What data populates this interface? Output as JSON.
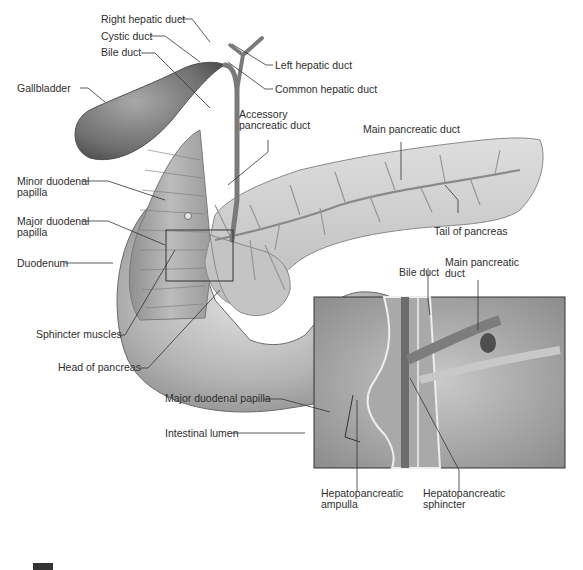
{
  "figure": {
    "labels": {
      "right_hepatic_duct": "Right hepatic duct",
      "cystic_duct": "Cystic duct",
      "bile_duct": "Bile duct",
      "left_hepatic_duct": "Left hepatic duct",
      "common_hepatic_duct": "Common hepatic duct",
      "gallbladder": "Gallbladder",
      "accessory_pancreatic_duct_1": "Accessory",
      "accessory_pancreatic_duct_2": "pancreatic duct",
      "main_pancreatic_duct": "Main pancreatic duct",
      "minor_duodenal_papilla_1": "Minor duodenal",
      "minor_duodenal_papilla_2": "papilla",
      "major_duodenal_papilla_1": "Major duodenal",
      "major_duodenal_papilla_2": "papilla",
      "tail_of_pancreas": "Tail of pancreas",
      "duodenum": "Duodenum",
      "sphincter_muscles": "Sphincter muscles",
      "head_of_pancreas": "Head of pancreas"
    },
    "inset_labels": {
      "bile_duct": "Bile duct",
      "main_pancreatic_duct_1": "Main pancreatic",
      "main_pancreatic_duct_2": "duct",
      "major_duodenal_papilla": "Major duodenal papilla",
      "intestinal_lumen": "Intestinal lumen",
      "hepatopancreatic_ampulla_1": "Hepatopancreatic",
      "hepatopancreatic_ampulla_2": "ampulla",
      "hepatopancreatic_sphincter_1": "Hepatopancreatic",
      "hepatopancreatic_sphincter_2": "sphincter"
    },
    "colors": {
      "organ_dark": "#6e6e6e",
      "organ_mid": "#9a9a9a",
      "organ_light": "#d6d6d6",
      "leader_line": "#333333",
      "background": "#ffffff"
    }
  }
}
